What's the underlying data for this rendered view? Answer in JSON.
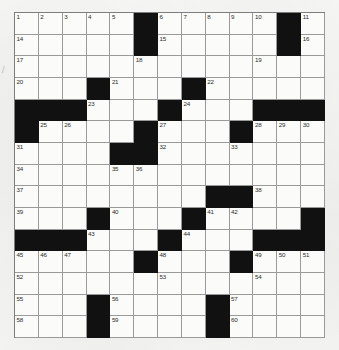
{
  "document": {
    "type": "crossword-puzzle-grid",
    "title": "Crossword Puzzle",
    "columns": 13,
    "rows": 15,
    "colors": {
      "page_background": "#f2f2f0",
      "cell_fill": "#fbfbfa",
      "block_fill": "#111111",
      "grid_line": "#9a9a9a",
      "number_text": "#2b2b2b"
    },
    "stray_mark": "/",
    "clue_number_count": 60,
    "grid": [
      [
        {
          "block": false,
          "num": "1"
        },
        {
          "block": false,
          "num": "2"
        },
        {
          "block": false,
          "num": "3"
        },
        {
          "block": false,
          "num": "4"
        },
        {
          "block": false,
          "num": "5"
        },
        {
          "block": true,
          "num": ""
        },
        {
          "block": false,
          "num": "6"
        },
        {
          "block": false,
          "num": "7"
        },
        {
          "block": false,
          "num": "8"
        },
        {
          "block": false,
          "num": "9"
        },
        {
          "block": false,
          "num": "10"
        },
        {
          "block": true,
          "num": ""
        },
        {
          "block": false,
          "num": "11"
        }
      ],
      [
        {
          "block": false,
          "num": "14"
        },
        {
          "block": false,
          "num": ""
        },
        {
          "block": false,
          "num": ""
        },
        {
          "block": false,
          "num": ""
        },
        {
          "block": false,
          "num": ""
        },
        {
          "block": true,
          "num": ""
        },
        {
          "block": false,
          "num": "15"
        },
        {
          "block": false,
          "num": ""
        },
        {
          "block": false,
          "num": ""
        },
        {
          "block": false,
          "num": ""
        },
        {
          "block": false,
          "num": ""
        },
        {
          "block": true,
          "num": ""
        },
        {
          "block": false,
          "num": "16"
        }
      ],
      [
        {
          "block": false,
          "num": "17"
        },
        {
          "block": false,
          "num": ""
        },
        {
          "block": false,
          "num": ""
        },
        {
          "block": false,
          "num": ""
        },
        {
          "block": false,
          "num": ""
        },
        {
          "block": false,
          "num": "18"
        },
        {
          "block": false,
          "num": ""
        },
        {
          "block": false,
          "num": ""
        },
        {
          "block": false,
          "num": ""
        },
        {
          "block": false,
          "num": ""
        },
        {
          "block": false,
          "num": "19"
        },
        {
          "block": false,
          "num": ""
        },
        {
          "block": false,
          "num": ""
        }
      ],
      [
        {
          "block": false,
          "num": "20"
        },
        {
          "block": false,
          "num": ""
        },
        {
          "block": false,
          "num": ""
        },
        {
          "block": true,
          "num": ""
        },
        {
          "block": false,
          "num": "21"
        },
        {
          "block": false,
          "num": ""
        },
        {
          "block": false,
          "num": ""
        },
        {
          "block": true,
          "num": ""
        },
        {
          "block": false,
          "num": "22"
        },
        {
          "block": false,
          "num": ""
        },
        {
          "block": false,
          "num": ""
        },
        {
          "block": false,
          "num": ""
        },
        {
          "block": false,
          "num": ""
        }
      ],
      [
        {
          "block": true,
          "num": ""
        },
        {
          "block": true,
          "num": ""
        },
        {
          "block": true,
          "num": ""
        },
        {
          "block": false,
          "num": "23"
        },
        {
          "block": false,
          "num": ""
        },
        {
          "block": false,
          "num": ""
        },
        {
          "block": true,
          "num": ""
        },
        {
          "block": false,
          "num": "24"
        },
        {
          "block": false,
          "num": ""
        },
        {
          "block": false,
          "num": ""
        },
        {
          "block": true,
          "num": ""
        },
        {
          "block": true,
          "num": ""
        },
        {
          "block": true,
          "num": ""
        }
      ],
      [
        {
          "block": true,
          "num": ""
        },
        {
          "block": false,
          "num": "25"
        },
        {
          "block": false,
          "num": "26"
        },
        {
          "block": false,
          "num": ""
        },
        {
          "block": false,
          "num": ""
        },
        {
          "block": true,
          "num": ""
        },
        {
          "block": false,
          "num": "27"
        },
        {
          "block": false,
          "num": ""
        },
        {
          "block": false,
          "num": ""
        },
        {
          "block": true,
          "num": ""
        },
        {
          "block": false,
          "num": "28"
        },
        {
          "block": false,
          "num": "29"
        },
        {
          "block": false,
          "num": "30"
        }
      ],
      [
        {
          "block": false,
          "num": "31"
        },
        {
          "block": false,
          "num": ""
        },
        {
          "block": false,
          "num": ""
        },
        {
          "block": false,
          "num": ""
        },
        {
          "block": true,
          "num": ""
        },
        {
          "block": true,
          "num": ""
        },
        {
          "block": false,
          "num": "32"
        },
        {
          "block": false,
          "num": ""
        },
        {
          "block": false,
          "num": ""
        },
        {
          "block": false,
          "num": "33"
        },
        {
          "block": false,
          "num": ""
        },
        {
          "block": false,
          "num": ""
        },
        {
          "block": false,
          "num": ""
        }
      ],
      [
        {
          "block": false,
          "num": "34"
        },
        {
          "block": false,
          "num": ""
        },
        {
          "block": false,
          "num": ""
        },
        {
          "block": false,
          "num": ""
        },
        {
          "block": false,
          "num": "35"
        },
        {
          "block": false,
          "num": "36"
        },
        {
          "block": false,
          "num": ""
        },
        {
          "block": false,
          "num": ""
        },
        {
          "block": false,
          "num": ""
        },
        {
          "block": false,
          "num": ""
        },
        {
          "block": false,
          "num": ""
        },
        {
          "block": false,
          "num": ""
        },
        {
          "block": false,
          "num": ""
        }
      ],
      [
        {
          "block": false,
          "num": "37"
        },
        {
          "block": false,
          "num": ""
        },
        {
          "block": false,
          "num": ""
        },
        {
          "block": false,
          "num": ""
        },
        {
          "block": false,
          "num": ""
        },
        {
          "block": false,
          "num": ""
        },
        {
          "block": false,
          "num": ""
        },
        {
          "block": false,
          "num": ""
        },
        {
          "block": true,
          "num": ""
        },
        {
          "block": true,
          "num": ""
        },
        {
          "block": false,
          "num": "38"
        },
        {
          "block": false,
          "num": ""
        },
        {
          "block": false,
          "num": ""
        }
      ],
      [
        {
          "block": false,
          "num": "39"
        },
        {
          "block": false,
          "num": ""
        },
        {
          "block": false,
          "num": ""
        },
        {
          "block": true,
          "num": ""
        },
        {
          "block": false,
          "num": "40"
        },
        {
          "block": false,
          "num": ""
        },
        {
          "block": false,
          "num": ""
        },
        {
          "block": true,
          "num": ""
        },
        {
          "block": false,
          "num": "41"
        },
        {
          "block": false,
          "num": "42"
        },
        {
          "block": false,
          "num": ""
        },
        {
          "block": false,
          "num": ""
        },
        {
          "block": true,
          "num": ""
        }
      ],
      [
        {
          "block": true,
          "num": ""
        },
        {
          "block": true,
          "num": ""
        },
        {
          "block": true,
          "num": ""
        },
        {
          "block": false,
          "num": "43"
        },
        {
          "block": false,
          "num": ""
        },
        {
          "block": false,
          "num": ""
        },
        {
          "block": true,
          "num": ""
        },
        {
          "block": false,
          "num": "44"
        },
        {
          "block": false,
          "num": ""
        },
        {
          "block": false,
          "num": ""
        },
        {
          "block": true,
          "num": ""
        },
        {
          "block": true,
          "num": ""
        },
        {
          "block": true,
          "num": ""
        }
      ],
      [
        {
          "block": false,
          "num": "45"
        },
        {
          "block": false,
          "num": "46"
        },
        {
          "block": false,
          "num": "47"
        },
        {
          "block": false,
          "num": ""
        },
        {
          "block": false,
          "num": ""
        },
        {
          "block": true,
          "num": ""
        },
        {
          "block": false,
          "num": "48"
        },
        {
          "block": false,
          "num": ""
        },
        {
          "block": false,
          "num": ""
        },
        {
          "block": true,
          "num": ""
        },
        {
          "block": false,
          "num": "49"
        },
        {
          "block": false,
          "num": "50"
        },
        {
          "block": false,
          "num": "51"
        }
      ],
      [
        {
          "block": false,
          "num": "52"
        },
        {
          "block": false,
          "num": ""
        },
        {
          "block": false,
          "num": ""
        },
        {
          "block": false,
          "num": ""
        },
        {
          "block": false,
          "num": ""
        },
        {
          "block": false,
          "num": ""
        },
        {
          "block": false,
          "num": "53"
        },
        {
          "block": false,
          "num": ""
        },
        {
          "block": false,
          "num": ""
        },
        {
          "block": false,
          "num": ""
        },
        {
          "block": false,
          "num": "54"
        },
        {
          "block": false,
          "num": ""
        },
        {
          "block": false,
          "num": ""
        }
      ],
      [
        {
          "block": false,
          "num": "55"
        },
        {
          "block": false,
          "num": ""
        },
        {
          "block": false,
          "num": ""
        },
        {
          "block": true,
          "num": ""
        },
        {
          "block": false,
          "num": "56"
        },
        {
          "block": false,
          "num": ""
        },
        {
          "block": false,
          "num": ""
        },
        {
          "block": false,
          "num": ""
        },
        {
          "block": true,
          "num": ""
        },
        {
          "block": false,
          "num": "57"
        },
        {
          "block": false,
          "num": ""
        },
        {
          "block": false,
          "num": ""
        },
        {
          "block": false,
          "num": ""
        }
      ],
      [
        {
          "block": false,
          "num": "58"
        },
        {
          "block": false,
          "num": ""
        },
        {
          "block": false,
          "num": ""
        },
        {
          "block": true,
          "num": ""
        },
        {
          "block": false,
          "num": "59"
        },
        {
          "block": false,
          "num": ""
        },
        {
          "block": false,
          "num": ""
        },
        {
          "block": false,
          "num": ""
        },
        {
          "block": true,
          "num": ""
        },
        {
          "block": false,
          "num": "60"
        },
        {
          "block": false,
          "num": ""
        },
        {
          "block": false,
          "num": ""
        },
        {
          "block": false,
          "num": ""
        }
      ]
    ]
  }
}
